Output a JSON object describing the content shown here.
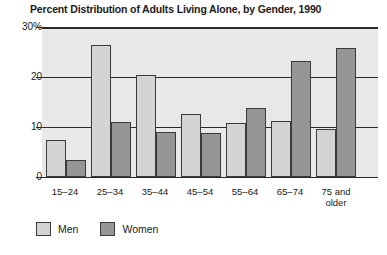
{
  "chart_data": {
    "type": "bar",
    "title": "Percent Distribution of Adults Living Alone, by Gender, 1990",
    "xlabel": "",
    "ylabel": "",
    "categories": [
      "15–24",
      "25–34",
      "35–44",
      "45–54",
      "55–64",
      "65–74",
      "75 and older"
    ],
    "series": [
      {
        "name": "Men",
        "color": "#d4d4d4",
        "values": [
          7.5,
          26.5,
          20.4,
          12.6,
          10.8,
          11.2,
          9.7
        ]
      },
      {
        "name": "Women",
        "color": "#969696",
        "values": [
          3.5,
          11.0,
          9.0,
          8.8,
          13.8,
          23.2,
          25.8
        ]
      }
    ],
    "ylim": [
      0,
      30
    ],
    "yticks": [
      0,
      10,
      20,
      30
    ],
    "ytick_labels": [
      "0",
      "10",
      "20",
      "30%"
    ],
    "grid": true,
    "legend_position": "bottom-left"
  },
  "legend": {
    "items": [
      {
        "label": "Men"
      },
      {
        "label": "Women"
      }
    ]
  }
}
